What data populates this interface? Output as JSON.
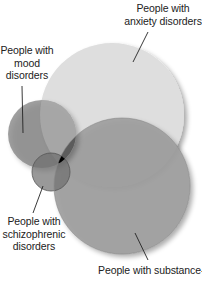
{
  "diagram": {
    "type": "venn",
    "sets": [
      {
        "id": "anxiety",
        "label_lines": [
          "People with",
          "anxiety disorders"
        ],
        "color": "#dcdcdc",
        "cx": 112,
        "cy": 115,
        "r": 72
      },
      {
        "id": "substance",
        "label_lines": [
          "People with substance-"
        ],
        "color": "#9a9a9a",
        "cx": 122,
        "cy": 186,
        "r": 68
      },
      {
        "id": "mood",
        "label_lines": [
          "People with",
          "mood",
          "disorders"
        ],
        "color": "#8a8a8a",
        "cx": 42,
        "cy": 134,
        "r": 34
      },
      {
        "id": "schizophrenic",
        "label_lines": [
          "People with",
          "schizophrenic",
          "disorders"
        ],
        "color": "#7a7a7a",
        "cx": 51,
        "cy": 172,
        "r": 19
      }
    ],
    "intersection_all_color": "#000000"
  }
}
